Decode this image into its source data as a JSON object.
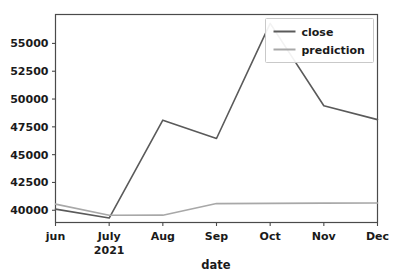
{
  "chart_data": {
    "type": "line",
    "title": "",
    "xlabel": "date",
    "ylabel": "",
    "grid": false,
    "legend_position": "top-right",
    "categories": [
      "jun",
      "July",
      "Aug",
      "Sep",
      "Oct",
      "Nov",
      "Dec"
    ],
    "x_tick_labels": [
      "jun",
      "July",
      "Aug",
      "Sep",
      "Oct",
      "Nov",
      "Dec"
    ],
    "x_tick_sublabels": [
      "",
      "2021",
      "",
      "",
      "",
      "",
      ""
    ],
    "y_tick_labels": [
      "40000",
      "42500",
      "45000",
      "47500",
      "50000",
      "52500",
      "55000"
    ],
    "y_tick_values": [
      40000,
      42500,
      45000,
      47500,
      50000,
      52500,
      55000
    ],
    "ylim": [
      38900,
      57600
    ],
    "xlim": [
      0,
      6
    ],
    "series": [
      {
        "name": "close",
        "color": "#5a5a5a",
        "values": [
          40100,
          39300,
          48100,
          46450,
          56800,
          49400,
          48150
        ]
      },
      {
        "name": "prediction",
        "color": "#a8a8a8",
        "values": [
          40550,
          39550,
          39560,
          40600,
          40620,
          40640,
          40650
        ]
      }
    ],
    "legend": [
      {
        "label": "close",
        "color": "#5a5a5a"
      },
      {
        "label": "prediction",
        "color": "#a8a8a8"
      }
    ]
  },
  "axes": {
    "x_axis_label": "date",
    "year_label": "2021"
  }
}
